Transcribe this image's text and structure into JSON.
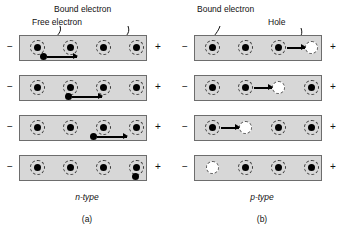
{
  "figure": {
    "background": "#ffffff",
    "bar_fill": "#d7d7d7",
    "bar_border": "#6d6d6d",
    "carrier_color": "#000000",
    "hole_color": "#ffffff"
  },
  "panels": [
    {
      "id": "a",
      "caption": "(a)",
      "type_label_italic": "n",
      "type_label_rest": "-type",
      "callouts": [
        {
          "name": "bound-electron",
          "text": "Bound electron",
          "x": 54,
          "y": 4
        },
        {
          "name": "free-electron",
          "text": "Free electron",
          "x": 32,
          "y": 17
        }
      ],
      "terminals": {
        "negative": "−",
        "positive": "+"
      },
      "rows": [
        {
          "index": 1,
          "atoms": [
            {
              "x": 10,
              "kind": "atom"
            },
            {
              "x": 43,
              "kind": "atom"
            },
            {
              "x": 76,
              "kind": "atom"
            },
            {
              "x": 109,
              "kind": "atom"
            }
          ],
          "free_electron": {
            "x": 20,
            "y": 17
          },
          "arrow": {
            "x": 27,
            "y": 20,
            "length": 30
          }
        },
        {
          "index": 2,
          "atoms": [
            {
              "x": 10,
              "kind": "atom"
            },
            {
              "x": 43,
              "kind": "atom"
            },
            {
              "x": 76,
              "kind": "atom"
            },
            {
              "x": 109,
              "kind": "atom"
            }
          ],
          "free_electron": {
            "x": 45,
            "y": 17
          },
          "arrow": {
            "x": 52,
            "y": 20,
            "length": 30
          }
        },
        {
          "index": 3,
          "atoms": [
            {
              "x": 10,
              "kind": "atom"
            },
            {
              "x": 43,
              "kind": "atom"
            },
            {
              "x": 76,
              "kind": "atom"
            },
            {
              "x": 109,
              "kind": "atom"
            }
          ],
          "free_electron": {
            "x": 70,
            "y": 17
          },
          "arrow": {
            "x": 77,
            "y": 20,
            "length": 30
          }
        },
        {
          "index": 4,
          "atoms": [
            {
              "x": 10,
              "kind": "atom"
            },
            {
              "x": 43,
              "kind": "atom"
            },
            {
              "x": 76,
              "kind": "atom"
            },
            {
              "x": 109,
              "kind": "atom"
            }
          ],
          "free_electron": {
            "x": 112,
            "y": 17
          },
          "arrow": null
        }
      ]
    },
    {
      "id": "b",
      "caption": "(b)",
      "type_label_italic": "p",
      "type_label_rest": "-type",
      "callouts": [
        {
          "name": "bound-electron",
          "text": "Bound electron",
          "x": 22,
          "y": 4
        },
        {
          "name": "hole",
          "text": "Hole",
          "x": 93,
          "y": 17
        }
      ],
      "terminals": {
        "negative": "−",
        "positive": "+"
      },
      "rows": [
        {
          "index": 1,
          "atoms": [
            {
              "x": 10,
              "kind": "atom"
            },
            {
              "x": 43,
              "kind": "atom"
            },
            {
              "x": 76,
              "kind": "atom"
            },
            {
              "x": 109,
              "kind": "hole"
            }
          ],
          "free_electron": null,
          "arrow": {
            "x": 92,
            "y": 11,
            "length": 18
          }
        },
        {
          "index": 2,
          "atoms": [
            {
              "x": 10,
              "kind": "atom"
            },
            {
              "x": 43,
              "kind": "atom"
            },
            {
              "x": 76,
              "kind": "hole"
            },
            {
              "x": 109,
              "kind": "atom"
            }
          ],
          "free_electron": null,
          "arrow": {
            "x": 59,
            "y": 11,
            "length": 18
          }
        },
        {
          "index": 3,
          "atoms": [
            {
              "x": 10,
              "kind": "atom"
            },
            {
              "x": 43,
              "kind": "hole"
            },
            {
              "x": 76,
              "kind": "atom"
            },
            {
              "x": 109,
              "kind": "atom"
            }
          ],
          "free_electron": null,
          "arrow": {
            "x": 26,
            "y": 11,
            "length": 18
          }
        },
        {
          "index": 4,
          "atoms": [
            {
              "x": 10,
              "kind": "hole"
            },
            {
              "x": 43,
              "kind": "atom"
            },
            {
              "x": 76,
              "kind": "atom"
            },
            {
              "x": 109,
              "kind": "atom"
            }
          ],
          "free_electron": null,
          "arrow": null
        }
      ]
    }
  ]
}
